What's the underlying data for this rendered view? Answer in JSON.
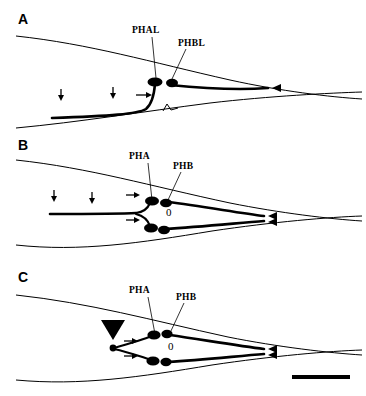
{
  "figure": {
    "type": "scientific-line-drawing",
    "background_color": "#ffffff",
    "ink_color": "#000000"
  },
  "panels": [
    {
      "letter": "A",
      "labels": [
        {
          "text": "PHAL",
          "target": "upper-anterior-soma"
        },
        {
          "text": "PHBL",
          "target": "upper-posterior-soma"
        }
      ],
      "soma_count": 2,
      "markers": {
        "down_arrows": 2,
        "right_arrows": 1,
        "arrowheads": 1,
        "open_hook": 1,
        "zero_marks": 0,
        "solid_triangle": 0
      }
    },
    {
      "letter": "B",
      "labels": [
        {
          "text": "PHA",
          "target": "upper-anterior-soma"
        },
        {
          "text": "PHB",
          "target": "upper-posterior-soma"
        }
      ],
      "soma_count": 4,
      "zero_mark": "0",
      "markers": {
        "down_arrows": 2,
        "right_arrows": 2,
        "arrowheads": 2,
        "open_hook": 0,
        "zero_marks": 1,
        "solid_triangle": 0
      }
    },
    {
      "letter": "C",
      "labels": [
        {
          "text": "PHA",
          "target": "upper-anterior-soma"
        },
        {
          "text": "PHB",
          "target": "upper-posterior-soma"
        }
      ],
      "soma_count": 4,
      "zero_mark": "0",
      "markers": {
        "down_arrows": 0,
        "right_arrows": 2,
        "arrowheads": 2,
        "open_hook": 0,
        "zero_marks": 1,
        "solid_triangle": 1
      }
    }
  ],
  "scale_bar": {
    "present": true,
    "label": "",
    "position": "bottom-right"
  }
}
